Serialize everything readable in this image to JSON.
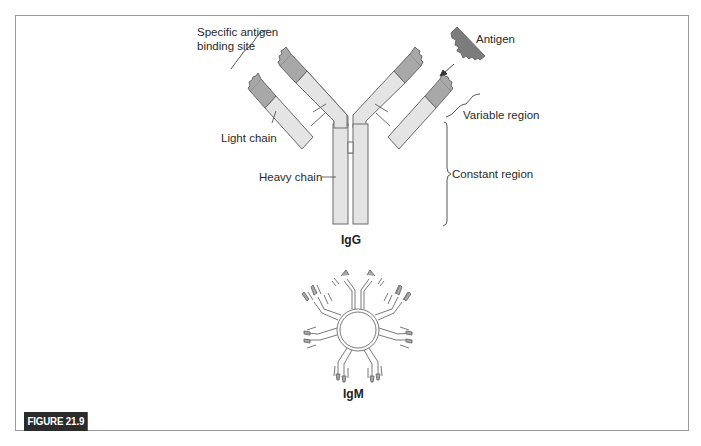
{
  "figure": {
    "label": "FIGURE 21.9"
  },
  "igg": {
    "title": "IgG",
    "labels": {
      "binding_site_line1": "Specific antigen",
      "binding_site_line2": "binding site",
      "light_chain": "Light chain",
      "heavy_chain": "Heavy chain",
      "antigen": "Antigen",
      "variable_region": "Variable region",
      "constant_region": "Constant region"
    }
  },
  "igm": {
    "title": "IgM"
  },
  "colors": {
    "light_fill": "#e4e4e4",
    "variable_fill": "#a8a8a8",
    "antigen_fill": "#7c7c7c",
    "stroke": "#6a6a6a",
    "frame": "#9a9a9a",
    "label_bg": "#2b2b2b"
  }
}
